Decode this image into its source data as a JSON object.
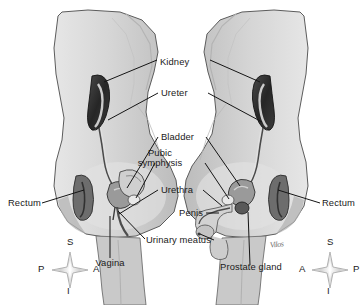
{
  "figure": {
    "background_color": "#ffffff",
    "ink_color": "#1a1a1a",
    "body_fill": "#d8d8d8",
    "body_shadow": "#b9b9b9",
    "organ_dark": "#2e2e2e",
    "organ_mid": "#7a7a7a",
    "organ_light": "#c2c2c2",
    "signature": "Vilos"
  },
  "labels": {
    "kidney": "Kidney",
    "ureter": "Ureter",
    "bladder": "Bladder",
    "pubic_symphysis_line1": "Pubic",
    "pubic_symphysis_line2": "symphysis",
    "urethra": "Urethra",
    "penis": "Penis",
    "urinary_meatus": "Urinary meatus",
    "rectum_left": "Rectum",
    "rectum_right": "Rectum",
    "vagina": "Vagina",
    "prostate_gland": "Prostate gland"
  },
  "compass_left": {
    "superior": "S",
    "inferior": "I",
    "posterior": "P",
    "anterior": "A"
  },
  "compass_right": {
    "superior": "S",
    "inferior": "I",
    "anterior": "A",
    "posterior": "P"
  }
}
